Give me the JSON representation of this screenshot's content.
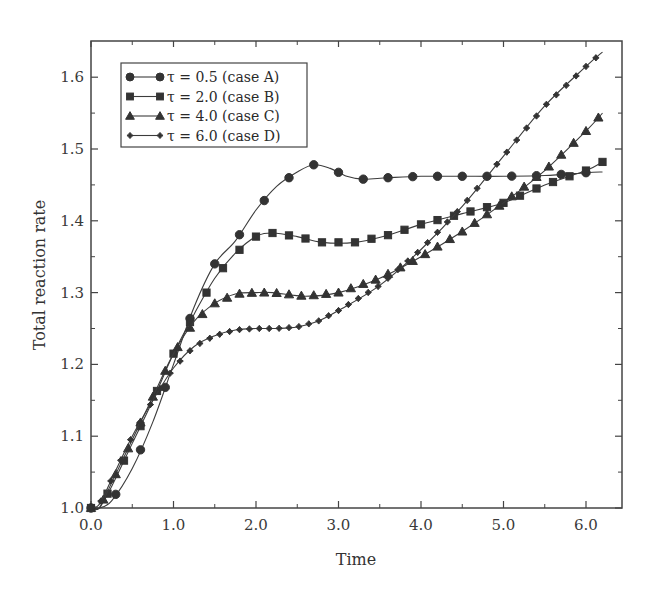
{
  "chart_data": {
    "type": "line",
    "title": "",
    "xlabel": "Time",
    "ylabel": "Total reaction rate",
    "xlim": [
      0.0,
      6.45
    ],
    "ylim": [
      1.0,
      1.65
    ],
    "x_ticks": [
      "0.0",
      "1.0",
      "2.0",
      "3.0",
      "4.0",
      "5.0",
      "6.0"
    ],
    "y_ticks": [
      "1.0",
      "1.1",
      "1.2",
      "1.3",
      "1.4",
      "1.5",
      "1.6"
    ],
    "grid": false,
    "legend_position": "upper left",
    "series": [
      {
        "name": "τ = 0.5 (case A)",
        "marker": "circle",
        "x": [
          0.0,
          0.1,
          0.25,
          0.5,
          0.75,
          1.0,
          1.25,
          1.5,
          1.75,
          2.0,
          2.25,
          2.5,
          2.7,
          2.9,
          3.1,
          3.3,
          3.6,
          4.0,
          4.5,
          5.0,
          5.5,
          6.0,
          6.2
        ],
        "values": [
          1.0,
          1.0,
          1.01,
          1.055,
          1.12,
          1.2,
          1.28,
          1.34,
          1.372,
          1.415,
          1.448,
          1.468,
          1.478,
          1.473,
          1.462,
          1.458,
          1.46,
          1.462,
          1.462,
          1.462,
          1.463,
          1.467,
          1.468
        ]
      },
      {
        "name": "τ = 2.0 (case B)",
        "marker": "square",
        "x": [
          0.0,
          0.1,
          0.25,
          0.5,
          0.75,
          1.0,
          1.25,
          1.5,
          1.75,
          2.0,
          2.2,
          2.5,
          2.8,
          3.2,
          3.6,
          4.0,
          4.5,
          5.0,
          5.5,
          6.0,
          6.2
        ],
        "values": [
          1.0,
          1.0,
          1.03,
          1.09,
          1.15,
          1.215,
          1.27,
          1.32,
          1.355,
          1.378,
          1.383,
          1.378,
          1.37,
          1.37,
          1.38,
          1.395,
          1.41,
          1.425,
          1.45,
          1.47,
          1.482
        ]
      },
      {
        "name": "τ = 4.0 (case C)",
        "marker": "triangle",
        "x": [
          0.0,
          0.1,
          0.25,
          0.5,
          0.75,
          1.0,
          1.25,
          1.5,
          1.75,
          2.0,
          2.2,
          2.6,
          3.0,
          3.5,
          4.0,
          4.5,
          5.0,
          5.5,
          6.0,
          6.2
        ],
        "values": [
          1.0,
          1.0,
          1.035,
          1.095,
          1.155,
          1.215,
          1.26,
          1.285,
          1.298,
          1.3,
          1.3,
          1.295,
          1.3,
          1.32,
          1.35,
          1.385,
          1.425,
          1.47,
          1.525,
          1.55
        ]
      },
      {
        "name": "τ = 6.0 (case D)",
        "marker": "star",
        "x": [
          0.0,
          0.1,
          0.25,
          0.5,
          0.75,
          1.0,
          1.25,
          1.5,
          1.75,
          2.0,
          2.25,
          2.5,
          2.75,
          3.0,
          3.5,
          4.0,
          4.5,
          5.0,
          5.5,
          6.0,
          6.2
        ],
        "values": [
          1.0,
          1.005,
          1.04,
          1.1,
          1.15,
          1.195,
          1.225,
          1.24,
          1.248,
          1.25,
          1.25,
          1.252,
          1.26,
          1.275,
          1.31,
          1.36,
          1.42,
          1.49,
          1.56,
          1.615,
          1.635
        ]
      }
    ]
  },
  "legend": {
    "entries": [
      "τ = 0.5 (case A)",
      "τ = 2.0 (case B)",
      "τ = 4.0 (case C)",
      "τ = 6.0 (case D)"
    ]
  },
  "axes": {
    "x_title": "Time",
    "y_title": "Total reaction rate"
  },
  "colors": {
    "line": "#3c3c3c",
    "marker": "#333333",
    "frame": "#444444",
    "text": "#333333"
  }
}
